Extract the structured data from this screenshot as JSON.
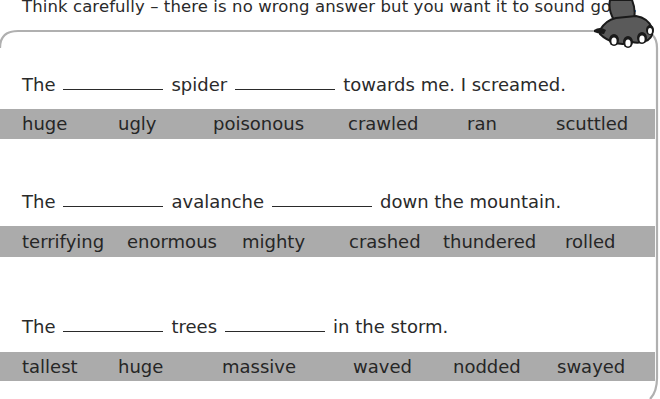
{
  "instruction": "Think carefully – there is no wrong answer but you want it to sound good.",
  "colors": {
    "band": "#ababab",
    "border": "#b0b0b0",
    "text": "#2a2a2a",
    "claw": "#5a5a5a"
  },
  "decoration": {
    "corner_icon": "claw-icon"
  },
  "exercises": [
    {
      "sentence": {
        "part1": "The",
        "part2": "spider",
        "part3": "towards me. I screamed."
      },
      "word_bank": [
        "huge",
        "ugly",
        "poisonous",
        "crawled",
        "ran",
        "scuttled"
      ]
    },
    {
      "sentence": {
        "part1": "The",
        "part2": "avalanche",
        "part3": "down the mountain."
      },
      "word_bank": [
        "terrifying",
        "enormous",
        "mighty",
        "crashed",
        "thundered",
        "rolled"
      ]
    },
    {
      "sentence": {
        "part1": "The",
        "part2": "trees",
        "part3": "in the storm."
      },
      "word_bank": [
        "tallest",
        "huge",
        "massive",
        "waved",
        "nodded",
        "swayed"
      ]
    }
  ]
}
